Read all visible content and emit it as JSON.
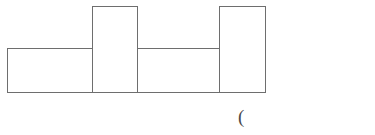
{
  "figure": {
    "title": "",
    "annotation_text": "(",
    "annotation_x": 238,
    "annotation_y": 107,
    "stroke_color": "#6e6e6e",
    "fill_color": "#ffffff",
    "background_color": "#ffffff",
    "stroke_width": 1
  },
  "chart_data": {
    "type": "bar",
    "title": "",
    "subtitle": "",
    "xlabel": "",
    "ylabel": "",
    "categories": [
      "1",
      "2",
      "3",
      "4"
    ],
    "values": [
      44,
      86,
      44,
      86
    ],
    "widths": [
      85,
      45,
      82,
      46
    ],
    "xlim": [
      7,
      265
    ],
    "ylim": [
      0,
      92
    ],
    "grid": false,
    "legend": null,
    "legend_position": "none",
    "tick_labels_x": [],
    "tick_labels_y": [],
    "annotations": [
      "("
    ],
    "bars": [
      {
        "index": 0,
        "x0": 7,
        "x1": 92,
        "top": 48,
        "bottom": 92,
        "height": 44,
        "width": 85
      },
      {
        "index": 1,
        "x0": 92,
        "x1": 137,
        "top": 6,
        "bottom": 92,
        "height": 86,
        "width": 45
      },
      {
        "index": 2,
        "x0": 137,
        "x1": 219,
        "top": 48,
        "bottom": 92,
        "height": 44,
        "width": 82
      },
      {
        "index": 3,
        "x0": 219,
        "x1": 265,
        "top": 6,
        "bottom": 92,
        "height": 86,
        "width": 46
      }
    ]
  }
}
